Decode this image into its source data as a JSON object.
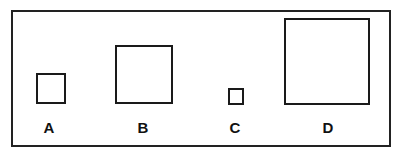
{
  "diagram": {
    "squares": [
      {
        "label": "A",
        "relative_size": "small"
      },
      {
        "label": "B",
        "relative_size": "medium"
      },
      {
        "label": "C",
        "relative_size": "smallest"
      },
      {
        "label": "D",
        "relative_size": "largest"
      }
    ]
  }
}
